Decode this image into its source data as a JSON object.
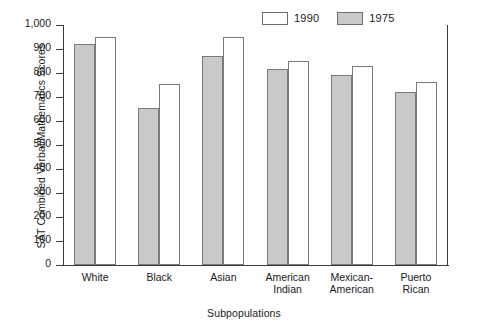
{
  "chart_data": {
    "type": "bar",
    "title": "",
    "xlabel": "Subpopulations",
    "ylabel": "SAT Combined Verbal/Mathematics Scores",
    "categories": [
      "White",
      "Black",
      "Asian",
      "American\nIndian",
      "Mexican-\nAmerican",
      "Puerto\nRican"
    ],
    "series": [
      {
        "name": "1975",
        "color": "#c9c9c9",
        "values": [
          920,
          655,
          872,
          815,
          790,
          720
        ]
      },
      {
        "name": "1990",
        "color": "#ffffff",
        "values": [
          952,
          753,
          950,
          850,
          828,
          763
        ]
      }
    ],
    "series_order_on_axis": [
      "1975",
      "1990"
    ],
    "legend_order": [
      "1990",
      "1975"
    ],
    "legend_position": "top-right",
    "ylim": [
      0,
      1000
    ],
    "yticks": [
      0,
      100,
      200,
      300,
      400,
      500,
      600,
      700,
      800,
      900,
      1000
    ],
    "ytick_labels": [
      "0",
      "100",
      "200",
      "300",
      "400",
      "500",
      "600",
      "700",
      "800",
      "900",
      "1,000"
    ],
    "grid": false,
    "frame": [
      "left",
      "bottom",
      "right"
    ]
  },
  "legend": {
    "entries": [
      {
        "label": "1990",
        "swatch": "open"
      },
      {
        "label": "1975",
        "swatch": "filled"
      }
    ]
  },
  "colors": {
    "bar_fill_1975": "#c9c9c9",
    "bar_fill_1990": "#ffffff",
    "bar_border": "#7a7a7a",
    "axis": "#3c3c3c",
    "text": "#1a1a1a",
    "background": "#ffffff"
  }
}
